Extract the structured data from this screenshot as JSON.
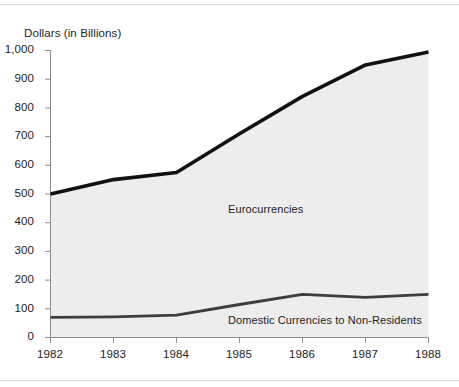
{
  "chart_data": {
    "type": "line",
    "title": "",
    "subtitle": "",
    "xlabel": "",
    "ylabel": "Dollars (in Billions)",
    "categories": [
      "1982",
      "1983",
      "1984",
      "1985",
      "1986",
      "1987",
      "1988"
    ],
    "x": [
      1982,
      1983,
      1984,
      1985,
      1986,
      1987,
      1988
    ],
    "xlim": [
      1982,
      1988
    ],
    "ylim": [
      0,
      1000
    ],
    "yticks": [
      0,
      100,
      200,
      300,
      400,
      500,
      600,
      700,
      800,
      900,
      1000
    ],
    "ytick_labels": [
      "0",
      "100",
      "200",
      "300",
      "400",
      "500",
      "600",
      "700",
      "800",
      "900",
      "1,000"
    ],
    "xtick_labels": [
      "1982",
      "1983",
      "1984",
      "1985",
      "1986",
      "1987",
      "1988"
    ],
    "grid": false,
    "legend_position": "inline-annotation",
    "area_fill": true,
    "fill_color": "#ededed",
    "series": [
      {
        "name": "Eurocurrencies",
        "values": [
          500,
          550,
          575,
          710,
          840,
          950,
          995
        ],
        "color": "#111111",
        "line_width": 3.6,
        "annotation": "Eurocurrencies"
      },
      {
        "name": "Domestic Currencies to Non-Residents",
        "values": [
          70,
          72,
          78,
          115,
          150,
          140,
          150
        ],
        "color": "#3d3d3d",
        "line_width": 2.8,
        "annotation": "Domestic Currencies to Non-Residents"
      }
    ],
    "annotations": [
      {
        "text": "Eurocurrencies",
        "x": 1985.4,
        "y": 465
      },
      {
        "text": "Domestic Currencies to Non-Residents",
        "x": 1985.4,
        "y": 75
      }
    ]
  },
  "axis": {
    "y_title": "Dollars (in Billions)",
    "y_labels": [
      "1,000",
      "900",
      "800",
      "700",
      "600",
      "500",
      "400",
      "300",
      "200",
      "100",
      "0"
    ],
    "x_labels": [
      "1982",
      "1983",
      "1984",
      "1985",
      "1986",
      "1987",
      "1988"
    ]
  },
  "labels": {
    "eurocurrencies": "Eurocurrencies",
    "domestic": "Domestic Currencies to Non-Residents"
  },
  "colors": {
    "axis": "#8c8c8c",
    "fill": "#ededed",
    "upper_line": "#111111",
    "lower_line": "#3d3d3d",
    "text": "#1c1c1c",
    "rule": "#d2d2d2"
  }
}
